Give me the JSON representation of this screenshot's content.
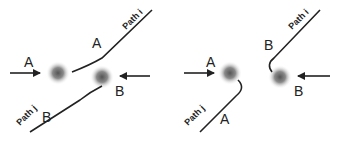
{
  "panels": [
    {
      "id": "left",
      "description": "Particles A and B exchange paths (deflected)",
      "labels": {
        "a_incoming": "A",
        "a_outgoing": "A",
        "b_incoming": "B",
        "b_outgoing": "B",
        "path_i": "Path i",
        "path_j": "Path j"
      }
    },
    {
      "id": "right",
      "description": "Particles A and B reflect back along paths",
      "labels": {
        "a_incoming": "A",
        "a_outgoing": "A",
        "b_incoming": "B",
        "b_outgoing": "B",
        "path_i": "Path i",
        "path_j": "Path j"
      }
    }
  ],
  "colors": {
    "line": "#222222",
    "particle_center": "#5a5a5a",
    "particle_edge": "#e8e8e8",
    "background": "#ffffff"
  }
}
